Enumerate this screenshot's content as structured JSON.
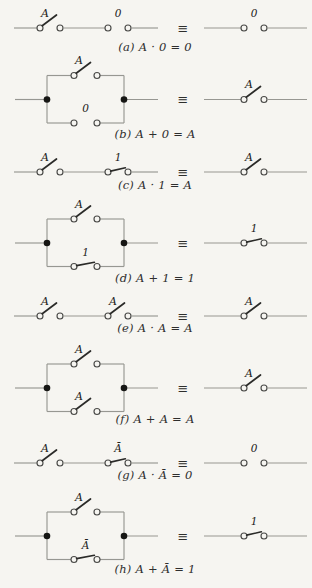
{
  "figure": {
    "equivalence_symbol": "≡",
    "colors": {
      "paper": "#f6f5f1",
      "wire": "#979792",
      "contact": "#4a4a48",
      "blade": "#2a2a28",
      "junction": "#161614",
      "label": "#222220",
      "caption": "#2e2e2c"
    },
    "rows": [
      {
        "id": "a",
        "caption": "(a) A · 0 = 0",
        "left": {
          "arrangement": "series",
          "switches": [
            {
              "label": "A",
              "state": "open"
            },
            {
              "label": "0",
              "state": "gap"
            }
          ]
        },
        "right": {
          "arrangement": "single",
          "switches": [
            {
              "label": "0",
              "state": "gap"
            }
          ]
        }
      },
      {
        "id": "b",
        "caption": "(b) A + 0 = A",
        "left": {
          "arrangement": "parallel",
          "switches": [
            {
              "label": "A",
              "state": "open"
            },
            {
              "label": "0",
              "state": "gap"
            }
          ]
        },
        "right": {
          "arrangement": "single",
          "switches": [
            {
              "label": "A",
              "state": "open"
            }
          ]
        }
      },
      {
        "id": "c",
        "caption": "(c) A · 1 = A",
        "left": {
          "arrangement": "series",
          "switches": [
            {
              "label": "A",
              "state": "open"
            },
            {
              "label": "1",
              "state": "closed"
            }
          ]
        },
        "right": {
          "arrangement": "single",
          "switches": [
            {
              "label": "A",
              "state": "open"
            }
          ]
        }
      },
      {
        "id": "d",
        "caption": "(d) A + 1 = 1",
        "left": {
          "arrangement": "parallel",
          "switches": [
            {
              "label": "A",
              "state": "open"
            },
            {
              "label": "1",
              "state": "closed"
            }
          ]
        },
        "right": {
          "arrangement": "single",
          "switches": [
            {
              "label": "1",
              "state": "closed"
            }
          ]
        }
      },
      {
        "id": "e",
        "caption": "(e) A · A = A",
        "left": {
          "arrangement": "series",
          "switches": [
            {
              "label": "A",
              "state": "open"
            },
            {
              "label": "A",
              "state": "open"
            }
          ]
        },
        "right": {
          "arrangement": "single",
          "switches": [
            {
              "label": "A",
              "state": "open"
            }
          ]
        }
      },
      {
        "id": "f",
        "caption": "(f) A + A = A",
        "left": {
          "arrangement": "parallel",
          "switches": [
            {
              "label": "A",
              "state": "open"
            },
            {
              "label": "A",
              "state": "open"
            }
          ]
        },
        "right": {
          "arrangement": "single",
          "switches": [
            {
              "label": "A",
              "state": "open"
            }
          ]
        }
      },
      {
        "id": "g",
        "caption": "(g) A · Ā = 0",
        "left": {
          "arrangement": "series",
          "switches": [
            {
              "label": "A",
              "state": "open"
            },
            {
              "label": "Ā",
              "state": "closed"
            }
          ]
        },
        "right": {
          "arrangement": "single",
          "switches": [
            {
              "label": "0",
              "state": "gap"
            }
          ]
        }
      },
      {
        "id": "h",
        "caption": "(h) A + Ā = 1",
        "left": {
          "arrangement": "parallel",
          "switches": [
            {
              "label": "A",
              "state": "open"
            },
            {
              "label": "Ā",
              "state": "closed"
            }
          ]
        },
        "right": {
          "arrangement": "single",
          "switches": [
            {
              "label": "1",
              "state": "closed"
            }
          ]
        }
      }
    ]
  }
}
